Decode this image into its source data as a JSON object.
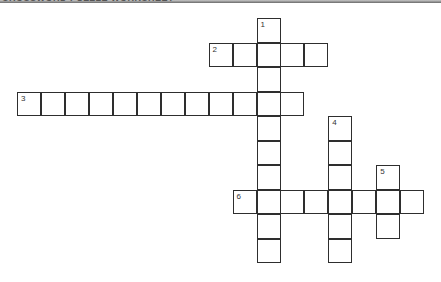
{
  "header": {
    "title": "CROSSWORD PUZZLE WORKSHEET"
  },
  "puzzle": {
    "cell_width": 23.95,
    "cell_height": 24.5,
    "origin": [
      17,
      18
    ],
    "border_color": "#2e2e2e",
    "words": [
      {
        "number": "1",
        "direction": "down",
        "row": 0,
        "col": 10,
        "length": 10
      },
      {
        "number": "2",
        "direction": "across",
        "row": 1,
        "col": 8,
        "length": 5
      },
      {
        "number": "3",
        "direction": "across",
        "row": 3,
        "col": 0,
        "length": 12
      },
      {
        "number": "4",
        "direction": "down",
        "row": 4,
        "col": 13,
        "length": 6
      },
      {
        "number": "5",
        "direction": "down",
        "row": 6,
        "col": 15,
        "length": 3
      },
      {
        "number": "6",
        "direction": "across",
        "row": 7,
        "col": 9,
        "length": 8
      }
    ]
  }
}
